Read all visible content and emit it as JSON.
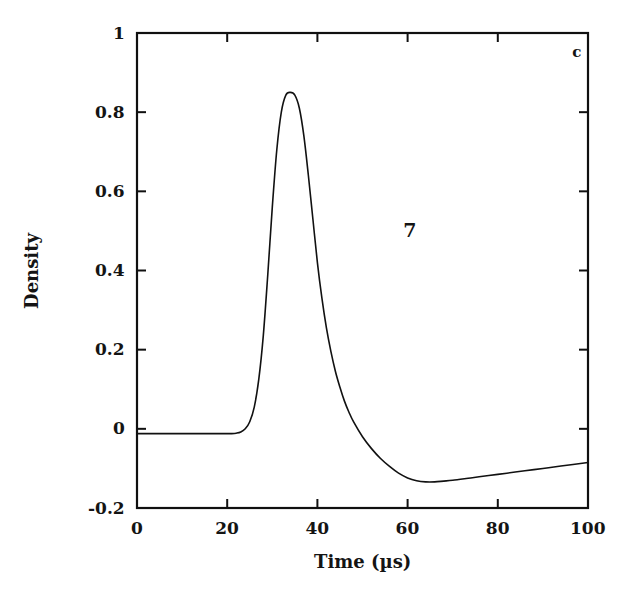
{
  "chart_data": {
    "type": "line",
    "title": "",
    "subtitle": "",
    "xlabel": "Time (µs)",
    "ylabel": "Density",
    "xlim": [
      0,
      100
    ],
    "ylim": [
      -0.2,
      1
    ],
    "grid": false,
    "legend": null,
    "xticks": [
      0,
      20,
      40,
      60,
      80,
      100
    ],
    "xticklabels": [
      "0",
      "20",
      "40",
      "60",
      "80",
      "100"
    ],
    "yticks": [
      -0.2,
      0,
      0.2,
      0.4,
      0.6,
      0.8,
      1
    ],
    "yticklabels": [
      "-0.2",
      "0",
      "0.2",
      "0.4",
      "0.6",
      "0.8",
      "1"
    ],
    "annotations": [
      {
        "name": "panel-letter",
        "text": "c",
        "x": 97.5,
        "y": 0.95
      },
      {
        "name": "curve-number",
        "text": "7",
        "x": 60.5,
        "y": 0.5
      }
    ],
    "series": [
      {
        "name": "density",
        "color": "#111111",
        "linewidth": 1.6,
        "x": [
          0,
          2,
          4,
          6,
          8,
          10,
          12,
          14,
          16,
          18,
          20,
          21,
          22,
          23,
          24,
          25,
          26,
          27,
          28,
          29,
          30,
          31,
          32,
          33,
          34,
          35,
          36,
          37,
          38,
          39,
          40,
          41,
          42,
          43,
          44,
          45,
          46,
          47,
          48,
          50,
          52,
          54,
          56,
          58,
          60,
          62,
          64,
          66,
          68,
          70,
          74,
          78,
          82,
          86,
          90,
          94,
          100
        ],
        "y": [
          -0.012,
          -0.012,
          -0.012,
          -0.012,
          -0.012,
          -0.012,
          -0.012,
          -0.012,
          -0.012,
          -0.012,
          -0.012,
          -0.012,
          -0.011,
          -0.008,
          0.0,
          0.018,
          0.055,
          0.125,
          0.235,
          0.39,
          0.56,
          0.705,
          0.8,
          0.843,
          0.85,
          0.843,
          0.81,
          0.74,
          0.64,
          0.53,
          0.42,
          0.33,
          0.255,
          0.195,
          0.145,
          0.105,
          0.07,
          0.042,
          0.018,
          -0.02,
          -0.05,
          -0.075,
          -0.095,
          -0.112,
          -0.124,
          -0.131,
          -0.134,
          -0.134,
          -0.132,
          -0.13,
          -0.124,
          -0.118,
          -0.112,
          -0.106,
          -0.1,
          -0.094,
          -0.085
        ]
      }
    ]
  },
  "axes": {
    "x_tick_labels": [
      "0",
      "20",
      "40",
      "60",
      "80",
      "100"
    ],
    "y_tick_labels": [
      "1",
      "0.8",
      "0.6",
      "0.4",
      "0.2",
      "0",
      "-0.2"
    ],
    "x_title": "Time (µs)",
    "y_title": "Density"
  },
  "labels": {
    "panel": "c",
    "curve_number": "7"
  },
  "colors": {
    "curve": "#111111",
    "axis": "#101010",
    "background": "#ffffff",
    "text": "#141414"
  }
}
